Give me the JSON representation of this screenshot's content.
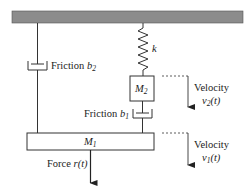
{
  "diagram": {
    "title": "",
    "components": {
      "ceiling": {
        "label": ""
      },
      "spring": {
        "label": "k"
      },
      "mass2": {
        "label": "M",
        "sub": "2"
      },
      "mass1": {
        "label": "M",
        "sub": "1"
      },
      "friction_b1": {
        "prefix": "Friction ",
        "symbol": "b",
        "sub": "1"
      },
      "friction_b2": {
        "prefix": "Friction ",
        "symbol": "b",
        "sub": "2"
      },
      "force": {
        "prefix": "Force ",
        "symbol": "r",
        "arg": "(t)"
      },
      "velocity2": {
        "label": "Velocity",
        "symbol": "v",
        "sub": "2",
        "arg": "(t)"
      },
      "velocity1": {
        "label": "Velocity",
        "symbol": "v",
        "sub": "1",
        "arg": "(t)"
      }
    },
    "colors": {
      "ceiling": "#8c8c8c",
      "line": "#333333"
    }
  }
}
